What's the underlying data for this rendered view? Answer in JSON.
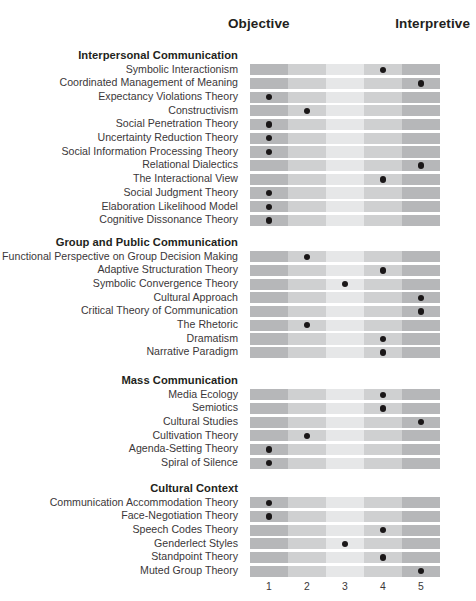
{
  "header": {
    "objective_label": "Objective",
    "interpretive_label": "Interpretive"
  },
  "scale_ticks": [
    "1",
    "2",
    "3",
    "4",
    "5"
  ],
  "chart_data": {
    "type": "scatter",
    "title": "",
    "xlabel": "",
    "ylabel": "",
    "xlim": [
      1,
      5
    ],
    "grid": false,
    "legend": null,
    "axis_endpoints": {
      "left": "Objective",
      "right": "Interpretive"
    },
    "x_tick_labels": [
      "1",
      "2",
      "3",
      "4",
      "5"
    ],
    "column_shades": [
      "#b6b7b9",
      "#cfd0d1",
      "#e6e7e8",
      "#cfd0d1",
      "#b6b7b9"
    ],
    "groups": [
      {
        "title": "Interpersonal Communication",
        "rows": [
          {
            "label": "Symbolic Interactionism",
            "value": 4
          },
          {
            "label": "Coordinated Management of Meaning",
            "value": 5
          },
          {
            "label": "Expectancy Violations Theory",
            "value": 1
          },
          {
            "label": "Constructivism",
            "value": 2
          },
          {
            "label": "Social Penetration Theory",
            "value": 1
          },
          {
            "label": "Uncertainty Reduction Theory",
            "value": 1
          },
          {
            "label": "Social Information Processing Theory",
            "value": 1
          },
          {
            "label": "Relational Dialectics",
            "value": 5
          },
          {
            "label": "The Interactional View",
            "value": 4
          },
          {
            "label": "Social Judgment Theory",
            "value": 1
          },
          {
            "label": "Elaboration Likelihood Model",
            "value": 1
          },
          {
            "label": "Cognitive Dissonance Theory",
            "value": 1
          }
        ]
      },
      {
        "title": "Group and Public Communication",
        "rows": [
          {
            "label": "Functional Perspective on Group Decision Making",
            "value": 2
          },
          {
            "label": "Adaptive Structuration Theory",
            "value": 4
          },
          {
            "label": "Symbolic Convergence Theory",
            "value": 3
          },
          {
            "label": "Cultural Approach",
            "value": 5
          },
          {
            "label": "Critical Theory of Communication",
            "value": 5
          },
          {
            "label": "The Rhetoric",
            "value": 2
          },
          {
            "label": "Dramatism",
            "value": 4
          },
          {
            "label": "Narrative Paradigm",
            "value": 4
          }
        ]
      },
      {
        "title": "Mass Communication",
        "rows": [
          {
            "label": "Media Ecology",
            "value": 4
          },
          {
            "label": "Semiotics",
            "value": 4
          },
          {
            "label": "Cultural Studies",
            "value": 5
          },
          {
            "label": "Cultivation Theory",
            "value": 2
          },
          {
            "label": "Agenda-Setting Theory",
            "value": 1
          },
          {
            "label": "Spiral of Silence",
            "value": 1
          }
        ]
      },
      {
        "title": "Cultural Context",
        "rows": [
          {
            "label": "Communication Accommodation Theory",
            "value": 1
          },
          {
            "label": "Face-Negotiation Theory",
            "value": 1
          },
          {
            "label": "Speech Codes Theory",
            "value": 4
          },
          {
            "label": "Genderlect Styles",
            "value": 3
          },
          {
            "label": "Standpoint Theory",
            "value": 4
          },
          {
            "label": "Muted Group Theory",
            "value": 5
          }
        ]
      }
    ]
  }
}
